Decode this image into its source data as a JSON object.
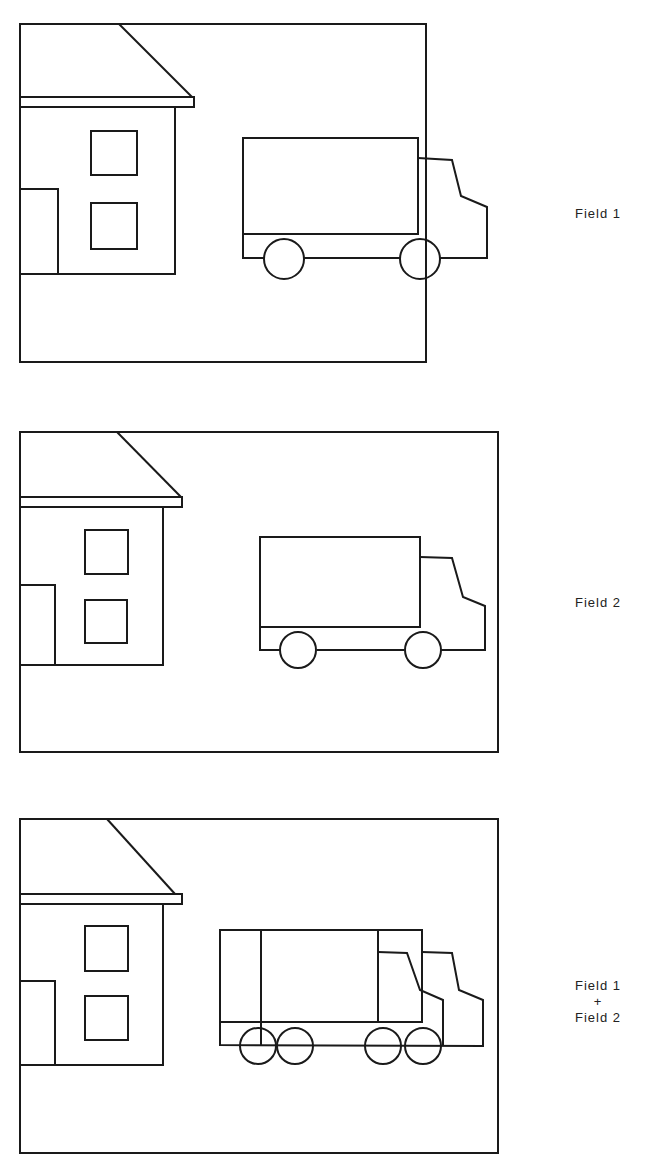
{
  "figure": {
    "top_cut_text": "...g p ... g...",
    "stroke_color": "#1a1a1a",
    "background": "#ffffff"
  },
  "panels": [
    {
      "id": "field-1",
      "label_lines": [
        "Field 1"
      ],
      "content": "house with two windows and door, single truck with two wheels"
    },
    {
      "id": "field-2",
      "label_lines": [
        "Field 2"
      ],
      "content": "same house, truck displaced right"
    },
    {
      "id": "field-1-plus-2",
      "label_lines": [
        "Field 1",
        "+",
        "Field 2"
      ],
      "content": "superimposed fields: house sharp, truck doubled with four wheels"
    }
  ]
}
